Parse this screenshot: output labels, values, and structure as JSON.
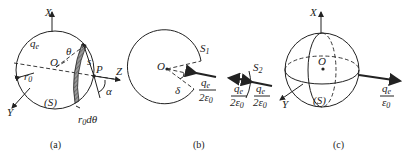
{
  "figure": {
    "panels": [
      {
        "id": "a",
        "caption": "(a)",
        "labels": {
          "x_axis": "X",
          "y_axis": "Y",
          "z_axis": "Z",
          "charge": "q",
          "charge_sub": "e",
          "origin": "O",
          "angle_theta": "θ",
          "arc_s": "s",
          "point_p": "P",
          "angle_alpha": "α",
          "radius": "r",
          "radius_sub": "0",
          "surface": "(S)",
          "ring_width": "r",
          "ring_width_sub": "0",
          "ring_width_tail": "dθ"
        }
      },
      {
        "id": "b",
        "caption": "(b)",
        "labels": {
          "surface_1": "S",
          "surface_1_sub": "1",
          "surface_2": "S",
          "surface_2_sub": "2",
          "origin": "O",
          "angle_delta": "δ",
          "flux_num": "q",
          "flux_num_sub": "e",
          "flux_den": "2ε",
          "flux_den_sub": "0"
        }
      },
      {
        "id": "c",
        "caption": "(c)",
        "labels": {
          "x_axis": "X",
          "y_axis": "Y",
          "origin": "O",
          "surface": "(S)",
          "flux_num": "q",
          "flux_num_sub": "e",
          "flux_den": "ε",
          "flux_den_sub": "0"
        }
      }
    ]
  }
}
